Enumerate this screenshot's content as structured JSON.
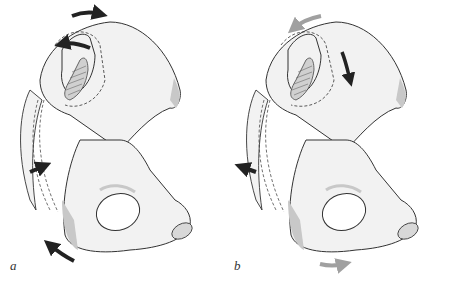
{
  "figure": {
    "panels": [
      {
        "id": "a",
        "label": "a",
        "arrows": [
          {
            "position": "top",
            "direction": "right",
            "color": "#222222"
          },
          {
            "position": "upper-inner",
            "direction": "left",
            "color": "#222222"
          },
          {
            "position": "middle-left",
            "direction": "right",
            "color": "#222222"
          },
          {
            "position": "bottom-left",
            "direction": "up-left",
            "color": "#222222"
          }
        ]
      },
      {
        "id": "b",
        "label": "b",
        "arrows": [
          {
            "position": "top",
            "direction": "left",
            "color": "#a0a0a0"
          },
          {
            "position": "upper-inner",
            "direction": "down",
            "color": "#222222"
          },
          {
            "position": "middle-left",
            "direction": "left",
            "color": "#222222"
          },
          {
            "position": "bottom",
            "direction": "right",
            "color": "#a0a0a0"
          }
        ]
      }
    ],
    "colors": {
      "bone_fill": "#f2f2f2",
      "bone_stroke": "#333333",
      "shade": "#c8c8c8",
      "dark_arrow": "#222222",
      "light_arrow": "#a0a0a0"
    }
  }
}
